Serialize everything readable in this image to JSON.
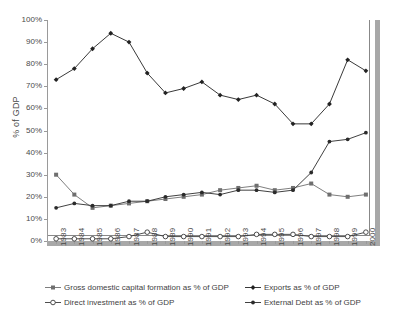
{
  "chart_data": {
    "type": "line",
    "title": "",
    "xlabel": "",
    "ylabel": "% of GDP",
    "ylim": [
      0,
      100
    ],
    "ytick_labels": [
      "0%",
      "10%",
      "20%",
      "30%",
      "40%",
      "50%",
      "60%",
      "70%",
      "80%",
      "90%",
      "100%"
    ],
    "ytick_values": [
      0,
      10,
      20,
      30,
      40,
      50,
      60,
      70,
      80,
      90,
      100
    ],
    "grid": false,
    "legend_position": "bottom",
    "categories": [
      "1983",
      "1984",
      "1985",
      "1986",
      "1987",
      "1988",
      "1989",
      "1990",
      "1991",
      "1992",
      "1993",
      "1994",
      "1995",
      "1996",
      "1997",
      "1998",
      "1999",
      "2000"
    ],
    "series": [
      {
        "name": "Gross domestic capital formation as % of GDP",
        "marker": "filled-square",
        "color": "#6f6f6f",
        "values": [
          30,
          21,
          15,
          16,
          17,
          18,
          19,
          20,
          21,
          23,
          24,
          25,
          23,
          24,
          26,
          21,
          20,
          21
        ]
      },
      {
        "name": "Exports as % of GDP",
        "marker": "filled-diamond",
        "color": "#222222",
        "values": [
          73,
          78,
          87,
          94,
          90,
          76,
          67,
          69,
          72,
          66,
          64,
          66,
          62,
          53,
          53,
          62,
          82,
          77
        ]
      },
      {
        "name": "Direct investment as % of GDP",
        "marker": "hollow-circle",
        "color": "#3a3a3a",
        "values": [
          1,
          1,
          1,
          1,
          2,
          4,
          2,
          2,
          2,
          2,
          2,
          3,
          3,
          3,
          2,
          2,
          2,
          4
        ]
      },
      {
        "name": "External Debt as % of GDP",
        "marker": "filled-dot",
        "color": "#2b2b2b",
        "values": [
          15,
          17,
          16,
          16,
          18,
          18,
          20,
          21,
          22,
          21,
          23,
          23,
          22,
          23,
          31,
          45,
          46,
          49
        ]
      }
    ]
  },
  "legend": {
    "rows": [
      [
        {
          "label": "Gross domestic capital formation as % of GDP",
          "series": 0
        },
        {
          "label": "Exports as % of GDP",
          "series": 1
        }
      ],
      [
        {
          "label": "Direct investment as % of GDP",
          "series": 2
        },
        {
          "label": "External Debt as % of GDP",
          "series": 3
        }
      ]
    ]
  }
}
